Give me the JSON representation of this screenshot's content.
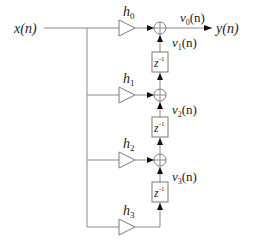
{
  "diagram": {
    "type": "FIR filter transposed direct form block diagram",
    "input_label": "x(n)",
    "output_label": "y(n)",
    "gains": [
      {
        "label": "h",
        "sub": "0"
      },
      {
        "label": "h",
        "sub": "1"
      },
      {
        "label": "h",
        "sub": "2"
      },
      {
        "label": "h",
        "sub": "3"
      }
    ],
    "delays": [
      {
        "label": "z",
        "sup": "-1"
      },
      {
        "label": "z",
        "sup": "-1"
      },
      {
        "label": "z",
        "sup": "-1"
      }
    ],
    "signals": [
      {
        "label": "v",
        "sub": "0",
        "arg": "(n)"
      },
      {
        "label": "v",
        "sub": "1",
        "arg": "(n)"
      },
      {
        "label": "v",
        "sub": "2",
        "arg": "(n)"
      },
      {
        "label": "v",
        "sub": "3",
        "arg": "(n)"
      }
    ],
    "adder_symbol": "⊕",
    "colors": {
      "wire": "#8a8a8a",
      "arrow": "#111111",
      "text": "#222222"
    }
  }
}
